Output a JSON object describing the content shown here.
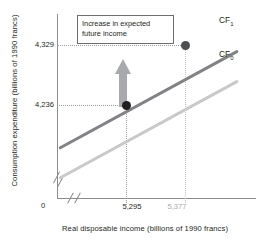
{
  "chart_data": {
    "type": "line",
    "title": "",
    "xlabel": "Real disposable income (billions of 1990 francs)",
    "ylabel": "Consumption expenditure (billions of 1990 francs)",
    "xlim": [
      5200,
      5450
    ],
    "ylim": [
      4180,
      4380
    ],
    "grid": false,
    "legend_position": "right-inline",
    "x_ticks": [
      "5,295",
      "5,377"
    ],
    "y_ticks": [
      "4,236",
      "4,329"
    ],
    "origin_label": "0",
    "axis_breaks": [
      "x-axis",
      "y-axis"
    ],
    "series": [
      {
        "name": "CF1",
        "label_text": "CF",
        "label_subscript": "1",
        "color": "#808285",
        "description": "Shifted-up consumption function after increase in expected future income"
      },
      {
        "name": "CF0",
        "label_text": "CF",
        "label_subscript": "0",
        "color": "#c7c9cb",
        "description": "Original consumption function"
      }
    ],
    "points": [
      {
        "name": "initial-equilibrium",
        "x": "5,295",
        "y": "4,236",
        "on_series": "CF0",
        "color": "#231f20"
      },
      {
        "name": "new-equilibrium",
        "x": "5,377",
        "y": "4,329",
        "on_series": "CF1",
        "color": "#4d4f51"
      }
    ],
    "annotations": [
      {
        "name": "shift-callout",
        "line1": "Increase in expected",
        "line2": "future income"
      },
      {
        "name": "shift-arrow",
        "direction": "up",
        "color": "#a7a9ac",
        "meaning": "Upward shift of the consumption function"
      }
    ]
  },
  "axes": {
    "y_title": "Consumption expenditure (billions of 1990 francs)",
    "x_title": "Real disposable income (billions of 1990 francs)",
    "origin": "0",
    "y_tick_upper": "4,329",
    "y_tick_lower": "4,236",
    "x_tick_left": "5,295",
    "x_tick_right": "5,377"
  },
  "labels": {
    "cf1_base": "CF",
    "cf1_sub": "1",
    "cf0_base": "CF",
    "cf0_sub": "0"
  },
  "callout": {
    "line1": "Increase in expected",
    "line2": "future income"
  },
  "colors": {
    "cf1": "#808285",
    "cf0": "#c7c9cb",
    "point_initial": "#231f20",
    "point_new": "#4d4f51",
    "arrow": "#a7a9ac",
    "axis": "#8a8c8e",
    "text": "#231f20",
    "muted_text": "#a7a9ac"
  }
}
